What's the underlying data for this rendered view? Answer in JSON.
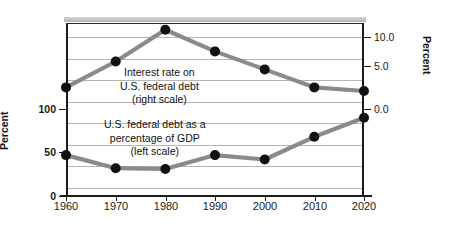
{
  "chart_data": {
    "type": "line",
    "title": "",
    "xlabel": "",
    "ylabel": "Percent",
    "x": [
      1960,
      1970,
      1980,
      1990,
      2000,
      2010,
      2020
    ],
    "xticklabels": [
      "1960",
      "1970",
      "1980",
      "1990",
      "2000",
      "2010",
      "2020"
    ],
    "xlim": [
      1958,
      2022
    ],
    "grid": true,
    "legend": "inline-annotations",
    "left_axis": {
      "label": "Percent",
      "ticks": [
        0,
        50,
        100
      ],
      "ticklabels": [
        "0",
        "50",
        "100"
      ],
      "lim": [
        0,
        200
      ]
    },
    "right_axis": {
      "label": "Percent",
      "ticks": [
        0.0,
        5.0,
        10.0
      ],
      "ticklabels": [
        "0.0",
        "5.0",
        "10.0"
      ],
      "lim": [
        -7.5,
        12.5
      ]
    },
    "series": [
      {
        "name": "U.S. federal debt as a percentage of GDP",
        "axis": "left",
        "color": "#8a8a8a",
        "marker_color": "#111111",
        "values": [
          47,
          32,
          31,
          47,
          42,
          68,
          90
        ]
      },
      {
        "name": "Interest rate on U.S. federal debt",
        "axis": "right",
        "color": "#8a8a8a",
        "marker_color": "#111111",
        "values": [
          3.0,
          6.6,
          11.0,
          8.0,
          5.5,
          3.0,
          2.5
        ]
      }
    ],
    "annotations": [
      {
        "id": "interest",
        "lines": [
          "Interest rate on",
          "U.S. federal debt",
          "(right scale)"
        ]
      },
      {
        "id": "debt",
        "lines": [
          "U.S. federal debt as a",
          "percentage of GDP",
          "(left scale)"
        ]
      }
    ]
  }
}
